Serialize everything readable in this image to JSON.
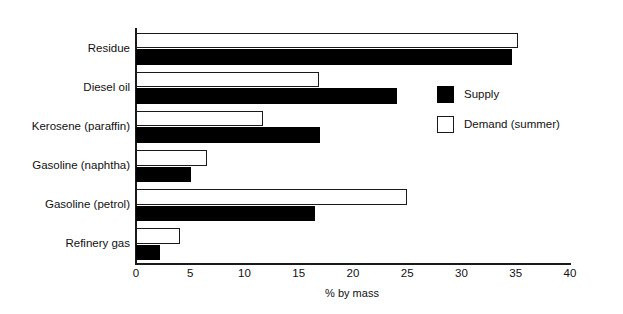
{
  "chart_data": {
    "type": "bar",
    "orientation": "horizontal",
    "title": "",
    "xlabel": "% by mass",
    "ylabel": "",
    "xlim": [
      0,
      40
    ],
    "xticks": [
      0,
      5,
      10,
      15,
      20,
      25,
      30,
      35,
      40
    ],
    "grid": false,
    "legend_position": "upper-right-inside",
    "categories": [
      "Residue",
      "Diesel oil",
      "Kerosene (paraffin)",
      "Gasoline (naphtha)",
      "Gasoline (petrol)",
      "Refinery gas"
    ],
    "series": [
      {
        "name": "Demand (summer)",
        "color": "#ffffff",
        "edge_color": "#1a1a1a",
        "values": [
          35.2,
          16.9,
          11.7,
          6.5,
          25.0,
          4.1
        ]
      },
      {
        "name": "Supply",
        "color": "#000000",
        "edge_color": "#000000",
        "values": [
          34.7,
          24.1,
          17.0,
          5.1,
          16.5,
          2.2
        ]
      }
    ]
  },
  "legend": {
    "items": [
      {
        "label": "Supply",
        "swatch": "filled-square"
      },
      {
        "label": "Demand (summer)",
        "swatch": "hollow-square"
      }
    ]
  },
  "axis": {
    "x_title": "% by mass",
    "tick_labels": [
      "0",
      "5",
      "10",
      "15",
      "20",
      "25",
      "30",
      "35",
      "40"
    ]
  },
  "colors": {
    "supply": "#000000",
    "demand": "#ffffff",
    "axis": "#1a1a1a",
    "background": "#ffffff",
    "text": "#111111"
  }
}
